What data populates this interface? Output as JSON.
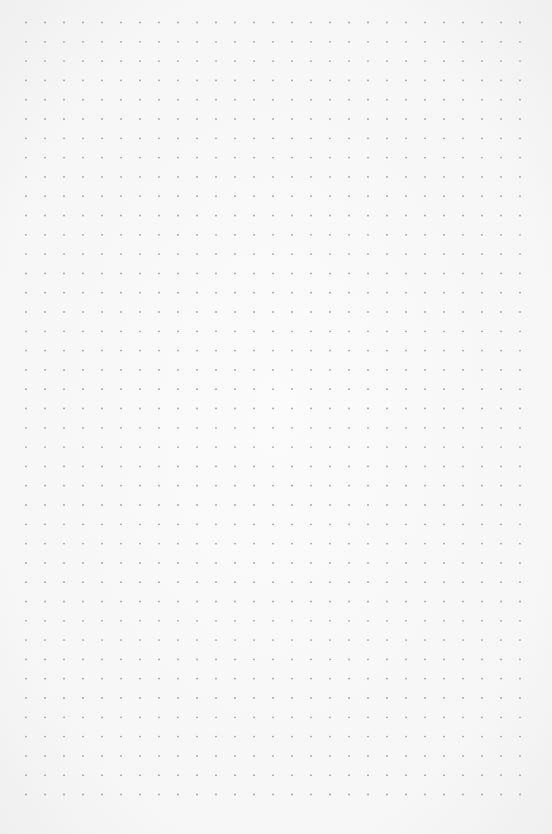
{
  "page": {
    "type": "dot-grid paper",
    "background_color": "#f8f8f8",
    "dot_color": "#a0a0a0"
  },
  "grid": {
    "columns": 27,
    "rows": 41,
    "origin_x": 26,
    "origin_y": 22.5,
    "spacing_x": 19,
    "spacing_y": 19.3,
    "dot_radius": 0.9
  }
}
